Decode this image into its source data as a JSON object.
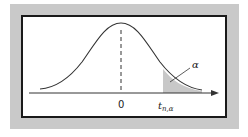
{
  "figure": {
    "labels": {
      "zero": "0",
      "critical_value_main": "t",
      "critical_value_sub": "n,α",
      "tail_area": "α"
    },
    "colors": {
      "frame": "#c9c9c9",
      "border": "#1a1a1a",
      "curve": "#333333",
      "shade": "#c8c8c8",
      "background": "#ffffff"
    }
  }
}
